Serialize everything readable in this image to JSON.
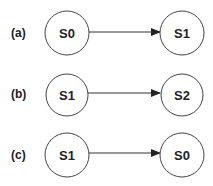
{
  "diagram": {
    "rows": [
      {
        "label": "(a)",
        "from": "S0",
        "to": "S1"
      },
      {
        "label": "(b)",
        "from": "S1",
        "to": "S2"
      },
      {
        "label": "(c)",
        "from": "S1",
        "to": "S0"
      }
    ],
    "colors": {
      "stroke": "#444444",
      "text": "#222222",
      "background": "#ffffff"
    }
  }
}
